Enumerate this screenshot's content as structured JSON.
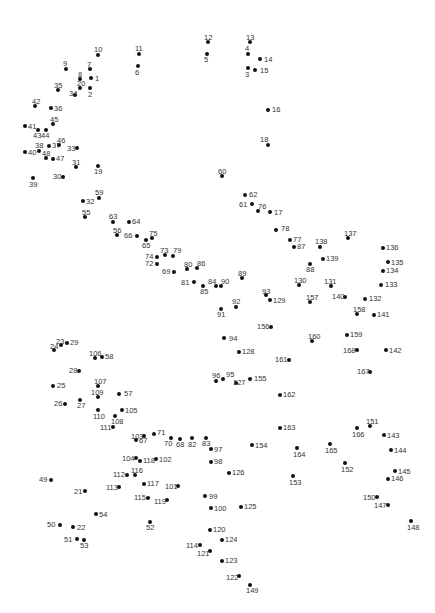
{
  "puzzle": {
    "type": "connect-the-dots",
    "dot_color": "#111111",
    "label_color": "#333333",
    "background": "#ffffff",
    "points": [
      {
        "n": "1",
        "x": 91,
        "y": 78,
        "lx": 95,
        "ly": 75
      },
      {
        "n": "2",
        "x": 90,
        "y": 88,
        "lx": 88,
        "ly": 91
      },
      {
        "n": "3",
        "x": 248,
        "y": 68,
        "lx": 245,
        "ly": 71
      },
      {
        "n": "4",
        "x": 248,
        "y": 54,
        "lx": 245,
        "ly": 45
      },
      {
        "n": "5",
        "x": 207,
        "y": 54,
        "lx": 204,
        "ly": 56
      },
      {
        "n": "6",
        "x": 138,
        "y": 66,
        "lx": 135,
        "ly": 69
      },
      {
        "n": "7",
        "x": 90,
        "y": 69,
        "lx": 87,
        "ly": 61
      },
      {
        "n": "8",
        "x": 80,
        "y": 79,
        "lx": 78,
        "ly": 71
      },
      {
        "n": "9",
        "x": 66,
        "y": 69,
        "lx": 63,
        "ly": 60
      },
      {
        "n": "10",
        "x": 98,
        "y": 55,
        "lx": 94,
        "ly": 46
      },
      {
        "n": "11",
        "x": 139,
        "y": 54,
        "lx": 135,
        "ly": 45
      },
      {
        "n": "12",
        "x": 208,
        "y": 42,
        "lx": 204,
        "ly": 34
      },
      {
        "n": "13",
        "x": 250,
        "y": 42,
        "lx": 246,
        "ly": 34
      },
      {
        "n": "14",
        "x": 260,
        "y": 59,
        "lx": 264,
        "ly": 56
      },
      {
        "n": "15",
        "x": 255,
        "y": 70,
        "lx": 260,
        "ly": 67
      },
      {
        "n": "16",
        "x": 268,
        "y": 110,
        "lx": 272,
        "ly": 106
      },
      {
        "n": "17",
        "x": 270,
        "y": 212,
        "lx": 274,
        "ly": 209
      },
      {
        "n": "18",
        "x": 268,
        "y": 145,
        "lx": 260,
        "ly": 136
      },
      {
        "n": "19",
        "x": 98,
        "y": 166,
        "lx": 94,
        "ly": 168
      },
      {
        "n": "20",
        "x": 80,
        "y": 88,
        "lx": 77,
        "ly": 80
      },
      {
        "n": "21",
        "x": 85,
        "y": 491,
        "lx": 74,
        "ly": 488
      },
      {
        "n": "22",
        "x": 73,
        "y": 527,
        "lx": 77,
        "ly": 524
      },
      {
        "n": "23",
        "x": 61,
        "y": 345,
        "lx": 56,
        "ly": 338
      },
      {
        "n": "24",
        "x": 54,
        "y": 350,
        "lx": 50,
        "ly": 343
      },
      {
        "n": "25",
        "x": 53,
        "y": 386,
        "lx": 57,
        "ly": 382
      },
      {
        "n": "26",
        "x": 65,
        "y": 404,
        "lx": 54,
        "ly": 400
      },
      {
        "n": "27",
        "x": 80,
        "y": 400,
        "lx": 77,
        "ly": 402
      },
      {
        "n": "28",
        "x": 79,
        "y": 371,
        "lx": 69,
        "ly": 367
      },
      {
        "n": "29",
        "x": 67,
        "y": 343,
        "lx": 70,
        "ly": 339
      },
      {
        "n": "30",
        "x": 63,
        "y": 177,
        "lx": 53,
        "ly": 173
      },
      {
        "n": "31",
        "x": 76,
        "y": 167,
        "lx": 72,
        "ly": 159
      },
      {
        "n": "32",
        "x": 83,
        "y": 201,
        "lx": 86,
        "ly": 198
      },
      {
        "n": "33",
        "x": 77,
        "y": 148,
        "lx": 67,
        "ly": 145
      },
      {
        "n": "34",
        "x": 75,
        "y": 95,
        "lx": 69,
        "ly": 90
      },
      {
        "n": "35",
        "x": 58,
        "y": 90,
        "lx": 54,
        "ly": 82
      },
      {
        "n": "36",
        "x": 51,
        "y": 108,
        "lx": 54,
        "ly": 105
      },
      {
        "n": "37",
        "x": 49,
        "y": 146,
        "lx": 52,
        "ly": 142
      },
      {
        "n": "38",
        "x": 39,
        "y": 151,
        "lx": 35,
        "ly": 142
      },
      {
        "n": "39",
        "x": 33,
        "y": 178,
        "lx": 29,
        "ly": 181
      },
      {
        "n": "40",
        "x": 25,
        "y": 152,
        "lx": 28,
        "ly": 149
      },
      {
        "n": "41",
        "x": 25,
        "y": 126,
        "lx": 28,
        "ly": 123
      },
      {
        "n": "42",
        "x": 35,
        "y": 106,
        "lx": 32,
        "ly": 98
      },
      {
        "n": "43",
        "x": 38,
        "y": 130,
        "lx": 33,
        "ly": 132
      },
      {
        "n": "44",
        "x": 46,
        "y": 130,
        "lx": 41,
        "ly": 132
      },
      {
        "n": "45",
        "x": 53,
        "y": 124,
        "lx": 50,
        "ly": 116
      },
      {
        "n": "46",
        "x": 59,
        "y": 145,
        "lx": 57,
        "ly": 137
      },
      {
        "n": "47",
        "x": 53,
        "y": 159,
        "lx": 56,
        "ly": 155
      },
      {
        "n": "48",
        "x": 46,
        "y": 158,
        "lx": 42,
        "ly": 150
      },
      {
        "n": "49",
        "x": 51,
        "y": 480,
        "lx": 39,
        "ly": 476
      },
      {
        "n": "50",
        "x": 60,
        "y": 525,
        "lx": 47,
        "ly": 521
      },
      {
        "n": "51",
        "x": 77,
        "y": 539,
        "lx": 64,
        "ly": 536
      },
      {
        "n": "52",
        "x": 150,
        "y": 522,
        "lx": 146,
        "ly": 524
      },
      {
        "n": "53",
        "x": 84,
        "y": 540,
        "lx": 80,
        "ly": 542
      },
      {
        "n": "54",
        "x": 96,
        "y": 514,
        "lx": 99,
        "ly": 511
      },
      {
        "n": "55",
        "x": 85,
        "y": 217,
        "lx": 82,
        "ly": 209
      },
      {
        "n": "56",
        "x": 117,
        "y": 235,
        "lx": 113,
        "ly": 227
      },
      {
        "n": "57",
        "x": 119,
        "y": 394,
        "lx": 124,
        "ly": 390
      },
      {
        "n": "58",
        "x": 102,
        "y": 357,
        "lx": 105,
        "ly": 353
      },
      {
        "n": "59",
        "x": 99,
        "y": 198,
        "lx": 95,
        "ly": 189
      },
      {
        "n": "60",
        "x": 222,
        "y": 176,
        "lx": 218,
        "ly": 168
      },
      {
        "n": "61",
        "x": 252,
        "y": 204,
        "lx": 239,
        "ly": 201
      },
      {
        "n": "62",
        "x": 245,
        "y": 195,
        "lx": 249,
        "ly": 191
      },
      {
        "n": "63",
        "x": 113,
        "y": 222,
        "lx": 109,
        "ly": 213
      },
      {
        "n": "64",
        "x": 129,
        "y": 222,
        "lx": 132,
        "ly": 218
      },
      {
        "n": "65",
        "x": 146,
        "y": 240,
        "lx": 142,
        "ly": 242
      },
      {
        "n": "66",
        "x": 137,
        "y": 236,
        "lx": 124,
        "ly": 232
      },
      {
        "n": "67",
        "x": 136,
        "y": 440,
        "lx": 139,
        "ly": 437
      },
      {
        "n": "68",
        "x": 180,
        "y": 439,
        "lx": 176,
        "ly": 441
      },
      {
        "n": "69",
        "x": 174,
        "y": 272,
        "lx": 162,
        "ly": 268
      },
      {
        "n": "70",
        "x": 171,
        "y": 438,
        "lx": 164,
        "ly": 440
      },
      {
        "n": "71",
        "x": 154,
        "y": 434,
        "lx": 157,
        "ly": 429
      },
      {
        "n": "72",
        "x": 157,
        "y": 264,
        "lx": 145,
        "ly": 260
      },
      {
        "n": "73",
        "x": 165,
        "y": 255,
        "lx": 160,
        "ly": 247
      },
      {
        "n": "74",
        "x": 157,
        "y": 257,
        "lx": 145,
        "ly": 253
      },
      {
        "n": "75",
        "x": 152,
        "y": 238,
        "lx": 149,
        "ly": 230
      },
      {
        "n": "76",
        "x": 258,
        "y": 211,
        "lx": 258,
        "ly": 203
      },
      {
        "n": "77",
        "x": 290,
        "y": 240,
        "lx": 293,
        "ly": 236
      },
      {
        "n": "78",
        "x": 276,
        "y": 230,
        "lx": 281,
        "ly": 225
      },
      {
        "n": "79",
        "x": 173,
        "y": 256,
        "lx": 173,
        "ly": 247
      },
      {
        "n": "80",
        "x": 187,
        "y": 269,
        "lx": 184,
        "ly": 261
      },
      {
        "n": "81",
        "x": 194,
        "y": 282,
        "lx": 181,
        "ly": 279
      },
      {
        "n": "82",
        "x": 192,
        "y": 438,
        "lx": 188,
        "ly": 441
      },
      {
        "n": "83",
        "x": 206,
        "y": 438,
        "lx": 202,
        "ly": 440
      },
      {
        "n": "84",
        "x": 216,
        "y": 286,
        "lx": 208,
        "ly": 278
      },
      {
        "n": "85",
        "x": 203,
        "y": 286,
        "lx": 200,
        "ly": 288
      },
      {
        "n": "86",
        "x": 197,
        "y": 268,
        "lx": 197,
        "ly": 260
      },
      {
        "n": "87",
        "x": 294,
        "y": 247,
        "lx": 297,
        "ly": 243
      },
      {
        "n": "88",
        "x": 310,
        "y": 264,
        "lx": 306,
        "ly": 266
      },
      {
        "n": "89",
        "x": 242,
        "y": 278,
        "lx": 238,
        "ly": 270
      },
      {
        "n": "90",
        "x": 221,
        "y": 286,
        "lx": 221,
        "ly": 278
      },
      {
        "n": "91",
        "x": 221,
        "y": 309,
        "lx": 217,
        "ly": 311
      },
      {
        "n": "92",
        "x": 236,
        "y": 307,
        "lx": 232,
        "ly": 298
      },
      {
        "n": "93",
        "x": 266,
        "y": 295,
        "lx": 262,
        "ly": 288
      },
      {
        "n": "94",
        "x": 224,
        "y": 338,
        "lx": 229,
        "ly": 335
      },
      {
        "n": "95",
        "x": 223,
        "y": 379,
        "lx": 226,
        "ly": 371
      },
      {
        "n": "96",
        "x": 216,
        "y": 381,
        "lx": 212,
        "ly": 372
      },
      {
        "n": "97",
        "x": 211,
        "y": 449,
        "lx": 214,
        "ly": 446
      },
      {
        "n": "98",
        "x": 211,
        "y": 462,
        "lx": 214,
        "ly": 458
      },
      {
        "n": "99",
        "x": 205,
        "y": 496,
        "lx": 209,
        "ly": 493
      },
      {
        "n": "100",
        "x": 211,
        "y": 508,
        "lx": 214,
        "ly": 505
      },
      {
        "n": "101",
        "x": 178,
        "y": 486,
        "lx": 165,
        "ly": 483
      },
      {
        "n": "102",
        "x": 156,
        "y": 459,
        "lx": 159,
        "ly": 456
      },
      {
        "n": "103",
        "x": 144,
        "y": 436,
        "lx": 131,
        "ly": 433
      },
      {
        "n": "104",
        "x": 136,
        "y": 458,
        "lx": 122,
        "ly": 455
      },
      {
        "n": "105",
        "x": 122,
        "y": 410,
        "lx": 125,
        "ly": 407
      },
      {
        "n": "106",
        "x": 95,
        "y": 358,
        "lx": 89,
        "ly": 350
      },
      {
        "n": "107",
        "x": 98,
        "y": 386,
        "lx": 94,
        "ly": 378
      },
      {
        "n": "108",
        "x": 115,
        "y": 416,
        "lx": 111,
        "ly": 418
      },
      {
        "n": "109",
        "x": 98,
        "y": 397,
        "lx": 91,
        "ly": 389
      },
      {
        "n": "110",
        "x": 98,
        "y": 410,
        "lx": 93,
        "ly": 413
      },
      {
        "n": "111",
        "x": 113,
        "y": 427,
        "lx": 100,
        "ly": 424
      },
      {
        "n": "112",
        "x": 127,
        "y": 475,
        "lx": 113,
        "ly": 471
      },
      {
        "n": "113",
        "x": 119,
        "y": 487,
        "lx": 106,
        "ly": 484
      },
      {
        "n": "114",
        "x": 200,
        "y": 545,
        "lx": 186,
        "ly": 542
      },
      {
        "n": "115",
        "x": 148,
        "y": 498,
        "lx": 134,
        "ly": 494
      },
      {
        "n": "116",
        "x": 135,
        "y": 475,
        "lx": 131,
        "ly": 467
      },
      {
        "n": "117",
        "x": 144,
        "y": 484,
        "lx": 147,
        "ly": 480
      },
      {
        "n": "118",
        "x": 140,
        "y": 461,
        "lx": 143,
        "ly": 457
      },
      {
        "n": "119",
        "x": 167,
        "y": 500,
        "lx": 154,
        "ly": 498
      },
      {
        "n": "120",
        "x": 210,
        "y": 530,
        "lx": 213,
        "ly": 526
      },
      {
        "n": "121",
        "x": 210,
        "y": 551,
        "lx": 197,
        "ly": 550
      },
      {
        "n": "122",
        "x": 239,
        "y": 576,
        "lx": 226,
        "ly": 574
      },
      {
        "n": "123",
        "x": 222,
        "y": 561,
        "lx": 225,
        "ly": 557
      },
      {
        "n": "124",
        "x": 222,
        "y": 540,
        "lx": 225,
        "ly": 536
      },
      {
        "n": "125",
        "x": 241,
        "y": 507,
        "lx": 244,
        "ly": 503
      },
      {
        "n": "126",
        "x": 229,
        "y": 473,
        "lx": 232,
        "ly": 469
      },
      {
        "n": "127",
        "x": 236,
        "y": 383,
        "lx": 233,
        "ly": 379
      },
      {
        "n": "128",
        "x": 239,
        "y": 352,
        "lx": 242,
        "ly": 348
      },
      {
        "n": "129",
        "x": 270,
        "y": 300,
        "lx": 273,
        "ly": 297
      },
      {
        "n": "130",
        "x": 299,
        "y": 285,
        "lx": 294,
        "ly": 277
      },
      {
        "n": "131",
        "x": 331,
        "y": 286,
        "lx": 324,
        "ly": 278
      },
      {
        "n": "132",
        "x": 365,
        "y": 299,
        "lx": 369,
        "ly": 295
      },
      {
        "n": "133",
        "x": 381,
        "y": 285,
        "lx": 385,
        "ly": 281
      },
      {
        "n": "134",
        "x": 383,
        "y": 271,
        "lx": 386,
        "ly": 267
      },
      {
        "n": "135",
        "x": 388,
        "y": 262,
        "lx": 391,
        "ly": 259
      },
      {
        "n": "136",
        "x": 383,
        "y": 248,
        "lx": 386,
        "ly": 244
      },
      {
        "n": "137",
        "x": 348,
        "y": 238,
        "lx": 344,
        "ly": 230
      },
      {
        "n": "138",
        "x": 320,
        "y": 247,
        "lx": 315,
        "ly": 238
      },
      {
        "n": "139",
        "x": 323,
        "y": 259,
        "lx": 326,
        "ly": 255
      },
      {
        "n": "140",
        "x": 345,
        "y": 297,
        "lx": 332,
        "ly": 293
      },
      {
        "n": "141",
        "x": 374,
        "y": 315,
        "lx": 377,
        "ly": 311
      },
      {
        "n": "142",
        "x": 386,
        "y": 350,
        "lx": 389,
        "ly": 347
      },
      {
        "n": "143",
        "x": 384,
        "y": 435,
        "lx": 387,
        "ly": 432
      },
      {
        "n": "144",
        "x": 391,
        "y": 450,
        "lx": 394,
        "ly": 447
      },
      {
        "n": "145",
        "x": 395,
        "y": 471,
        "lx": 398,
        "ly": 468
      },
      {
        "n": "146",
        "x": 388,
        "y": 479,
        "lx": 391,
        "ly": 475
      },
      {
        "n": "147",
        "x": 388,
        "y": 505,
        "lx": 374,
        "ly": 502
      },
      {
        "n": "148",
        "x": 411,
        "y": 521,
        "lx": 407,
        "ly": 524
      },
      {
        "n": "149",
        "x": 250,
        "y": 585,
        "lx": 246,
        "ly": 587
      },
      {
        "n": "150",
        "x": 377,
        "y": 497,
        "lx": 363,
        "ly": 494
      },
      {
        "n": "151",
        "x": 370,
        "y": 426,
        "lx": 366,
        "ly": 418
      },
      {
        "n": "152",
        "x": 345,
        "y": 463,
        "lx": 341,
        "ly": 466
      },
      {
        "n": "153",
        "x": 293,
        "y": 476,
        "lx": 289,
        "ly": 479
      },
      {
        "n": "154",
        "x": 252,
        "y": 445,
        "lx": 255,
        "ly": 442
      },
      {
        "n": "155",
        "x": 250,
        "y": 379,
        "lx": 254,
        "ly": 375
      },
      {
        "n": "156",
        "x": 271,
        "y": 327,
        "lx": 257,
        "ly": 323
      },
      {
        "n": "157",
        "x": 310,
        "y": 302,
        "lx": 306,
        "ly": 294
      },
      {
        "n": "158",
        "x": 357,
        "y": 314,
        "lx": 353,
        "ly": 306
      },
      {
        "n": "159",
        "x": 347,
        "y": 335,
        "lx": 350,
        "ly": 331
      },
      {
        "n": "160",
        "x": 312,
        "y": 341,
        "lx": 308,
        "ly": 333
      },
      {
        "n": "161",
        "x": 289,
        "y": 360,
        "lx": 275,
        "ly": 356
      },
      {
        "n": "162",
        "x": 280,
        "y": 395,
        "lx": 283,
        "ly": 391
      },
      {
        "n": "163",
        "x": 280,
        "y": 428,
        "lx": 283,
        "ly": 424
      },
      {
        "n": "164",
        "x": 297,
        "y": 448,
        "lx": 293,
        "ly": 451
      },
      {
        "n": "165",
        "x": 330,
        "y": 444,
        "lx": 325,
        "ly": 447
      },
      {
        "n": "166",
        "x": 357,
        "y": 428,
        "lx": 352,
        "ly": 431
      },
      {
        "n": "167",
        "x": 370,
        "y": 372,
        "lx": 357,
        "ly": 368
      },
      {
        "n": "168",
        "x": 357,
        "y": 350,
        "lx": 343,
        "ly": 347
      }
    ]
  }
}
